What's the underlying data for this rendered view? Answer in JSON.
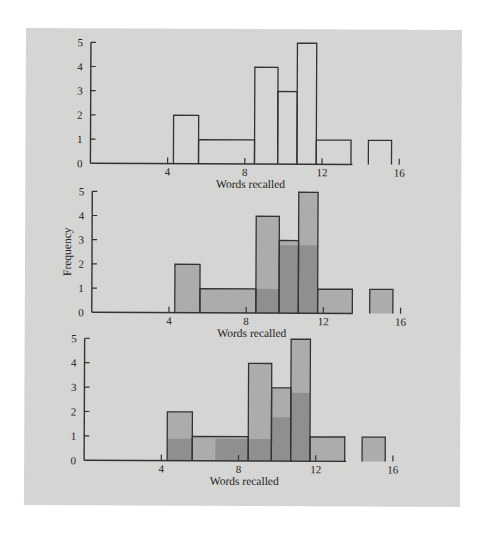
{
  "colors": {
    "background": "#d5d5d3",
    "outline": "#333333",
    "fill_light": "#acacaa",
    "fill_dark": "#8f8f8d"
  },
  "chart_data": [
    {
      "type": "bar",
      "style": "outline-histogram",
      "title": "",
      "xlabel": "Words recalled",
      "ylabel": "",
      "xticks": [
        4,
        8,
        12,
        16
      ],
      "yticks": [
        0,
        1,
        2,
        3,
        4,
        5
      ],
      "xlim": [
        0,
        16
      ],
      "ylim": [
        0,
        5
      ],
      "bins": [
        {
          "x0": 4.3,
          "x1": 5.6,
          "count": 2
        },
        {
          "x0": 5.6,
          "x1": 8.5,
          "count": 1
        },
        {
          "x0": 8.5,
          "x1": 9.7,
          "count": 4
        },
        {
          "x0": 9.7,
          "x1": 10.7,
          "count": 3
        },
        {
          "x0": 10.7,
          "x1": 11.7,
          "count": 5
        },
        {
          "x0": 11.7,
          "x1": 13.5,
          "count": 1
        },
        {
          "x0": 14.4,
          "x1": 15.6,
          "count": 1
        }
      ],
      "layers": []
    },
    {
      "type": "bar",
      "style": "filled-histogram",
      "title": "",
      "xlabel": "Words recalled",
      "ylabel": "Frequency",
      "xticks": [
        4,
        8,
        12,
        16
      ],
      "yticks": [
        0,
        1,
        2,
        3,
        4,
        5
      ],
      "xlim": [
        0,
        16
      ],
      "ylim": [
        0,
        5
      ],
      "bins": [
        {
          "x0": 4.3,
          "x1": 5.6,
          "count": 2
        },
        {
          "x0": 5.6,
          "x1": 8.5,
          "count": 1
        },
        {
          "x0": 8.5,
          "x1": 9.7,
          "count": 4
        },
        {
          "x0": 9.7,
          "x1": 10.7,
          "count": 3
        },
        {
          "x0": 10.7,
          "x1": 11.7,
          "count": 5
        },
        {
          "x0": 11.7,
          "x1": 13.5,
          "count": 1
        },
        {
          "x0": 14.4,
          "x1": 15.6,
          "count": 1
        }
      ],
      "layers": [
        {
          "x0": 8.5,
          "x1": 9.7,
          "height": 1,
          "shade": "dark"
        },
        {
          "x0": 9.7,
          "x1": 11.7,
          "height": 2.8,
          "shade": "dark"
        }
      ]
    },
    {
      "type": "bar",
      "style": "filled-histogram",
      "title": "",
      "xlabel": "Words recalled",
      "ylabel": "",
      "xticks": [
        4,
        8,
        12,
        16
      ],
      "yticks": [
        0,
        1,
        2,
        3,
        4,
        5
      ],
      "xlim": [
        0,
        16
      ],
      "ylim": [
        0,
        5
      ],
      "bins": [
        {
          "x0": 4.3,
          "x1": 5.6,
          "count": 2
        },
        {
          "x0": 5.6,
          "x1": 8.5,
          "count": 1
        },
        {
          "x0": 8.5,
          "x1": 9.7,
          "count": 4
        },
        {
          "x0": 9.7,
          "x1": 10.7,
          "count": 3
        },
        {
          "x0": 10.7,
          "x1": 11.7,
          "count": 5
        },
        {
          "x0": 11.7,
          "x1": 13.5,
          "count": 1
        },
        {
          "x0": 14.4,
          "x1": 15.6,
          "count": 1
        }
      ],
      "layers": [
        {
          "x0": 4.3,
          "x1": 5.6,
          "height": 0.9,
          "shade": "dark"
        },
        {
          "x0": 6.8,
          "x1": 9.7,
          "height": 0.9,
          "shade": "dark"
        },
        {
          "x0": 9.7,
          "x1": 10.7,
          "height": 1.8,
          "shade": "dark"
        },
        {
          "x0": 10.7,
          "x1": 11.7,
          "height": 2.8,
          "shade": "dark"
        }
      ]
    }
  ]
}
